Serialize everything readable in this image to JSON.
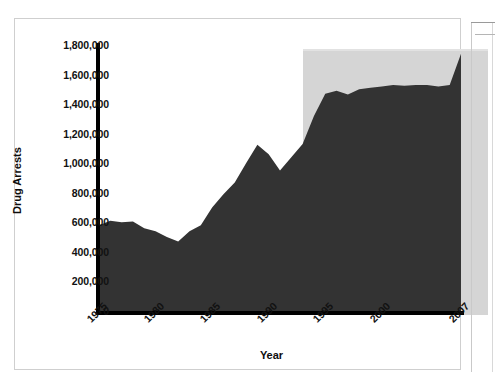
{
  "chart_data": {
    "type": "area",
    "title": "",
    "xlabel": "Year",
    "ylabel": "Drug Arrests",
    "xlim": [
      1975,
      2007
    ],
    "ylim": [
      0,
      1800000
    ],
    "grid": false,
    "legend": null,
    "y_ticks": [
      "1,800,000",
      "1,600,000",
      "1,400,000",
      "1,200,000",
      "1,000,000",
      "800,000",
      "600,000",
      "400,000",
      "200,000",
      "0"
    ],
    "y_tick_values": [
      1800000,
      1600000,
      1400000,
      1200000,
      1000000,
      800000,
      600000,
      400000,
      200000,
      0
    ],
    "x_ticks": [
      "1975",
      "1980",
      "1985",
      "1990",
      "1995",
      "2000",
      "2007"
    ],
    "x_tick_values": [
      1975,
      1980,
      1985,
      1990,
      1995,
      2000,
      2007
    ],
    "series": [
      {
        "name": "Drug Arrests",
        "fill_color": "#333333",
        "x": [
          1975,
          1976,
          1977,
          1978,
          1979,
          1980,
          1981,
          1982,
          1983,
          1984,
          1985,
          1986,
          1987,
          1988,
          1989,
          1990,
          1991,
          1992,
          1993,
          1994,
          1995,
          1996,
          1997,
          1998,
          1999,
          2000,
          2001,
          2002,
          2003,
          2004,
          2005,
          2006,
          2007
        ],
        "values": [
          580000,
          610000,
          600000,
          605000,
          560000,
          540000,
          500000,
          470000,
          540000,
          580000,
          700000,
          790000,
          870000,
          1000000,
          1125000,
          1060000,
          950000,
          1040000,
          1130000,
          1320000,
          1470000,
          1490000,
          1465000,
          1500000,
          1510000,
          1520000,
          1530000,
          1525000,
          1530000,
          1530000,
          1520000,
          1530000,
          1740000
        ]
      }
    ],
    "shaded_region": {
      "label": "",
      "from": 1993,
      "to": 2007,
      "color": "#d5d5d5"
    }
  },
  "figure": {
    "frame_color": "#cfcfcf",
    "background": "#ffffff",
    "axis_color": "#000000"
  }
}
